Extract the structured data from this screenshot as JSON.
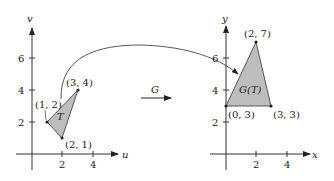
{
  "figure": {
    "transform_label": "G",
    "left_plot": {
      "x_axis_label": "u",
      "y_axis_label": "v",
      "x_ticks": [
        "2",
        "4"
      ],
      "y_ticks": [
        "2",
        "4",
        "6"
      ],
      "region_label": "T",
      "vertices": [
        {
          "label": "(1, 2)",
          "u": 1,
          "v": 2
        },
        {
          "label": "(3, 4)",
          "u": 3,
          "v": 4
        },
        {
          "label": "(2, 1)",
          "u": 2,
          "v": 1
        }
      ],
      "fill_color": "#bdbdbd"
    },
    "right_plot": {
      "x_axis_label": "x",
      "y_axis_label": "y",
      "x_ticks": [
        "2",
        "4"
      ],
      "y_ticks": [
        "2",
        "4",
        "6"
      ],
      "region_label": "G(T)",
      "vertices": [
        {
          "label": "(2, 7)",
          "x": 2,
          "y": 7
        },
        {
          "label": "(0, 3)",
          "x": 0,
          "y": 3
        },
        {
          "label": "(3, 3)",
          "x": 3,
          "y": 3
        }
      ],
      "fill_color": "#bdbdbd"
    }
  }
}
